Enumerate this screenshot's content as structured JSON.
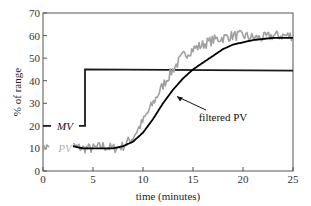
{
  "chart_data": {
    "type": "line",
    "title": "",
    "xlabel": "time (minutes)",
    "ylabel": "% of range",
    "xlim": [
      0,
      25
    ],
    "ylim": [
      0,
      70
    ],
    "xticks": [
      0,
      5,
      10,
      15,
      20,
      25
    ],
    "yticks": [
      0,
      10,
      20,
      30,
      40,
      50,
      60,
      70
    ],
    "grid": false,
    "legend": "inline labels",
    "series": [
      {
        "name": "MV",
        "label_style": "italic",
        "color": "#1a1a1a",
        "x": [
          0,
          4.2,
          4.2,
          25
        ],
        "y": [
          20,
          20,
          45,
          44.5
        ]
      },
      {
        "name": "PV",
        "label_style": "italic",
        "color": "#a0a0a0",
        "noisy": true,
        "x": [
          0,
          0.5,
          3,
          4,
          5,
          6,
          7,
          8,
          9,
          10,
          11,
          12,
          13,
          14,
          15,
          16,
          17,
          18,
          19,
          20,
          21,
          22,
          23,
          24,
          25
        ],
        "y": [
          10,
          11,
          11,
          10,
          10,
          11,
          10,
          11,
          15,
          22,
          30,
          38,
          45,
          51,
          54,
          56,
          58,
          59,
          60,
          60,
          59,
          59,
          60,
          60,
          60
        ]
      },
      {
        "name": "filtered PV",
        "label_style": "normal",
        "color": "#000000",
        "x": [
          3,
          4,
          5,
          6,
          7,
          8,
          9,
          10,
          11,
          12,
          13,
          14,
          15,
          16,
          17,
          18,
          19,
          20,
          21,
          22,
          23,
          24,
          25
        ],
        "y": [
          11,
          10,
          10,
          10,
          10,
          11,
          13,
          17,
          23,
          30,
          36,
          41,
          45,
          48,
          51,
          54,
          56,
          57,
          58,
          58.5,
          59,
          59,
          59
        ]
      }
    ],
    "annotations": [
      {
        "text": "MV",
        "x": 1.7,
        "y": 20
      },
      {
        "text": "PV",
        "x": 1.7,
        "y": 10
      },
      {
        "text": "filtered PV",
        "x": 16.8,
        "y": 24,
        "arrow_to": [
          13.4,
          33
        ]
      }
    ]
  },
  "axes": {
    "xlabel": "time (minutes)",
    "ylabel": "% of range",
    "xtick_labels": [
      "0",
      "5",
      "10",
      "15",
      "20",
      "25"
    ],
    "ytick_labels": [
      "0",
      "10",
      "20",
      "30",
      "40",
      "50",
      "60",
      "70"
    ]
  },
  "labels": {
    "mv": "MV",
    "pv": "PV",
    "filtered_pv": "filtered PV"
  }
}
